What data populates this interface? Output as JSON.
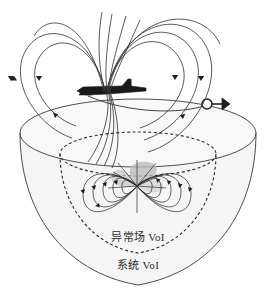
{
  "figure": {
    "title": "",
    "background_color": "#ffffff",
    "line_color": "#3a3a3a",
    "fill_color": "#f4f4f4",
    "lobe_fill_color": "#b8b8b8"
  },
  "labels": {
    "inner_region": "异常场 VoI",
    "outer_region": "系统 VoI"
  },
  "elements": {
    "aircraft": "aircraft-silhouette",
    "towed_sensor": "towed-bird-sensor",
    "tow_cable": "tow-cable",
    "upper_dipole": "aircraft-magnetic-dipole-field",
    "lower_dipole": "anomaly-magnetic-dipole-field",
    "hemisphere": "system-voi-hemisphere",
    "inner_boundary": "anomaly-voi-dashed-boundary"
  },
  "geometry": {
    "hemisphere_center_x": 138,
    "hemisphere_rim_y": 133,
    "hemisphere_rx": 118,
    "hemisphere_ry": 34,
    "hemisphere_bottom_y": 285,
    "inner_ellipse_rx": 78,
    "inner_ellipse_ry": 23,
    "aircraft_x": 108,
    "aircraft_y": 91,
    "sensor_x": 215,
    "sensor_y": 105,
    "anomaly_x": 137,
    "anomaly_y": 188
  }
}
